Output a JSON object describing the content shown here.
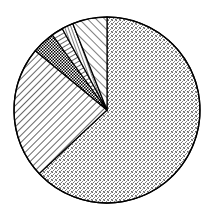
{
  "chart_data": {
    "type": "pie",
    "title": "",
    "labels": [
      "Slice A",
      "Slice B",
      "Slice C",
      "Slice D",
      "Slice E",
      "Slice F"
    ],
    "values": [
      63,
      23,
      4,
      2,
      2,
      6
    ],
    "patterns": [
      "dotted",
      "diagonal-lines",
      "crosshatch",
      "horizontal-lines",
      "vertical-lines",
      "back-diagonal-lines"
    ],
    "start_angle_deg": 0,
    "direction": "clockwise",
    "legend": "none",
    "colors": {
      "stroke": "#000000",
      "fill": "#ffffff",
      "dots": "#777777"
    }
  }
}
